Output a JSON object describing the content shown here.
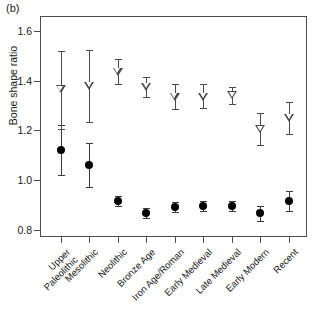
{
  "figure": {
    "panel_label": "(b)",
    "ylabel": "Bone shape ratio"
  },
  "chart_data": {
    "type": "scatter",
    "title": "",
    "subtitle": "",
    "panel": "(b)",
    "xlabel": "",
    "ylabel": "Bone shape ratio",
    "ylim": [
      0.77,
      1.66
    ],
    "yticks": [
      0.8,
      1.0,
      1.2,
      1.4,
      1.6
    ],
    "ytick_labels": [
      "0.8",
      "1.0",
      "1.2",
      "1.4",
      "1.6"
    ],
    "grid": false,
    "legend": "none",
    "error_bars": "95% confidence interval",
    "categories": [
      "Upper Paleolithic",
      "Mesolithic",
      "Neolithic",
      "Bronze Age",
      "Iron Age/Roman",
      "Early Medieval",
      "Late Medieval",
      "Early Modern",
      "Recent"
    ],
    "category_labels_wrapped": [
      [
        "Upper",
        "Paleolithic"
      ],
      [
        "Mesolithic"
      ],
      [
        "Neolithic"
      ],
      [
        "Bronze Age"
      ],
      [
        "Iron Age/Roman"
      ],
      [
        "Early Medieval"
      ],
      [
        "Late Medieval"
      ],
      [
        "Early Modern"
      ],
      [
        "Recent"
      ]
    ],
    "series": [
      {
        "name": "filled-circle",
        "marker": "filled circle",
        "color": "#000000",
        "values": [
          1.12,
          1.06,
          0.915,
          0.865,
          0.89,
          0.895,
          0.895,
          0.865,
          0.915
        ],
        "lower": [
          1.02,
          0.97,
          0.895,
          0.845,
          0.87,
          0.875,
          0.875,
          0.835,
          0.875
        ],
        "upper": [
          1.22,
          1.15,
          0.935,
          0.885,
          0.91,
          0.915,
          0.915,
          0.895,
          0.955
        ]
      },
      {
        "name": "open-triangle",
        "marker": "open downward triangle",
        "color": "#4a4a4a",
        "values": [
          1.365,
          1.38,
          1.435,
          1.375,
          1.335,
          1.335,
          1.34,
          1.205,
          1.25
        ],
        "lower": [
          1.205,
          1.235,
          1.385,
          1.335,
          1.285,
          1.29,
          1.305,
          1.14,
          1.185
        ],
        "upper": [
          1.52,
          1.525,
          1.485,
          1.415,
          1.385,
          1.385,
          1.375,
          1.27,
          1.315
        ]
      }
    ]
  }
}
